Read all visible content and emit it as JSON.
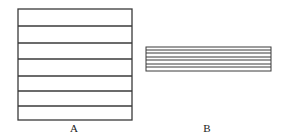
{
  "figure": {
    "a": {
      "label": "A",
      "box": {
        "x": 18,
        "y": 9,
        "w": 114,
        "h": 111
      },
      "lines_y": [
        26,
        43,
        59,
        76,
        91,
        106
      ],
      "label_pos": {
        "x": 74,
        "y": 122
      }
    },
    "b": {
      "label": "B",
      "box": {
        "x": 146,
        "y": 47,
        "w": 125,
        "h": 24
      },
      "lines_y": [
        50,
        53,
        57,
        60,
        64,
        67
      ],
      "label_pos": {
        "x": 207,
        "y": 122
      }
    },
    "stroke_color": "#3a3a3a"
  }
}
